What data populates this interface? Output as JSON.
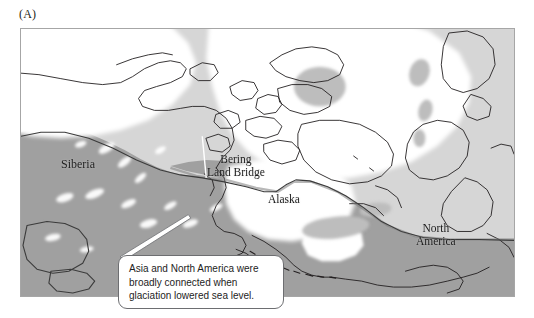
{
  "figure": {
    "panel_label": "(A)"
  },
  "map": {
    "labels": {
      "siberia": "Siberia",
      "bering_land_bridge": "Bering\nLand Bridge",
      "alaska": "Alaska",
      "north_america": "North\nAmerica"
    },
    "colors": {
      "ocean": "#d6d6d6",
      "exposed_land": "#a0a0a0",
      "ice_sheet": "#ffffff",
      "coastline": "#231f20",
      "frame_border": "#a6a6a6",
      "callout_border": "#6d6e71",
      "callout_fill": "#ffffff",
      "text": "#1d1d1d"
    }
  },
  "callout": {
    "line1": "Asia and North America were",
    "line2": "broadly connected when",
    "line3": "glaciation lowered sea level."
  }
}
